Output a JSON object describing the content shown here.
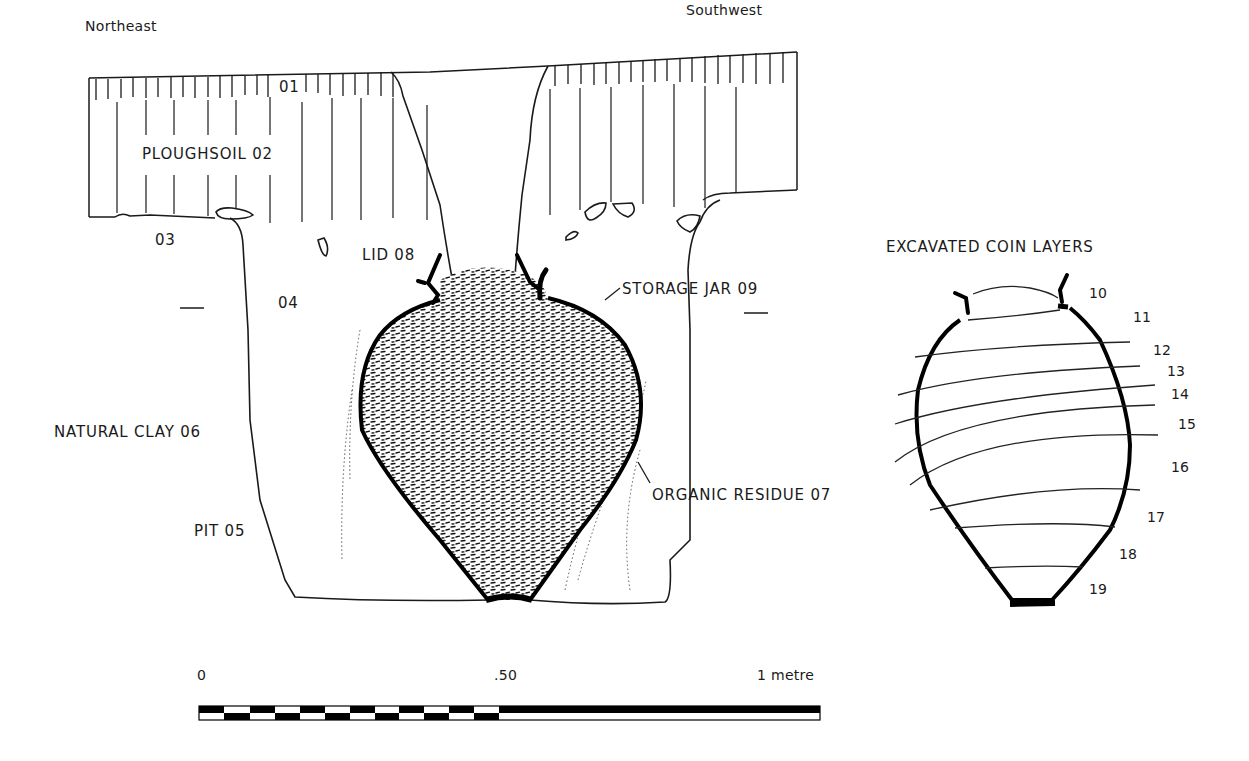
{
  "section": {
    "orientation": {
      "left": "Northeast",
      "right": "Southwest"
    },
    "layers": [
      {
        "id": "01",
        "label": "01"
      },
      {
        "id": "02",
        "label": "PLOUGHSOIL 02"
      },
      {
        "id": "03",
        "label": "03"
      },
      {
        "id": "04",
        "label": "04"
      },
      {
        "id": "05",
        "label": "PIT 05"
      },
      {
        "id": "06",
        "label": "NATURAL CLAY 06"
      },
      {
        "id": "07",
        "label": "ORGANIC RESIDUE 07"
      },
      {
        "id": "08",
        "label": "LID 08"
      },
      {
        "id": "09",
        "label": "STORAGE JAR 09"
      }
    ]
  },
  "coin_jar": {
    "title": "EXCAVATED COIN LAYERS",
    "layers": [
      "10",
      "11",
      "12",
      "13",
      "14",
      "15",
      "16",
      "17",
      "18",
      "19"
    ]
  },
  "scale_bar": {
    "start": "0",
    "mid": ".50",
    "end": "1 metre"
  }
}
